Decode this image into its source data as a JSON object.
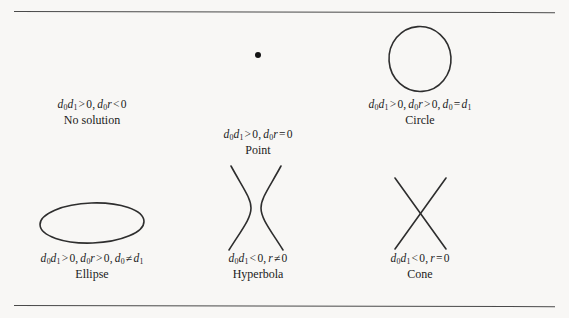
{
  "figure": {
    "background_color": "#f8f7f5",
    "stroke_color": "#2e2e2e",
    "rule_color": "#4a4a4a"
  },
  "rules": {
    "top_label": "top-horizontal-rule",
    "bottom_label": "bottom-horizontal-rule"
  },
  "panels": [
    {
      "shape": "none",
      "formula_parts": {
        "p1": "d",
        "s1": "0",
        "p2": "d",
        "s2": "1",
        "rel1": ">",
        "val1": "0",
        "comma": ",",
        "p3": "d",
        "s3": "0",
        "p4": "r",
        "rel2": "<",
        "val2": "0"
      },
      "formula_text": "d0d1 > 0, d0r < 0",
      "name": "No solution"
    },
    {
      "shape": "point",
      "formula_parts": {
        "p1": "d",
        "s1": "0",
        "p2": "d",
        "s2": "1",
        "rel1": ">",
        "val1": "0",
        "comma": ",",
        "p3": "d",
        "s3": "0",
        "p4": "r",
        "rel2": "=",
        "val2": "0"
      },
      "formula_text": "d0d1 > 0, d0r = 0",
      "name": "Point"
    },
    {
      "shape": "circle",
      "formula_parts": {
        "p1": "d",
        "s1": "0",
        "p2": "d",
        "s2": "1",
        "rel1": ">",
        "val1": "0",
        "comma": ",",
        "p3": "d",
        "s3": "0",
        "p4": "r",
        "rel2": ">",
        "val2": "0",
        "comma2": ",",
        "p5": "d",
        "s5": "0",
        "rel3": "=",
        "p6": "d",
        "s6": "1"
      },
      "formula_text": "d0d1 > 0, d0r > 0, d0 = d1",
      "name": "Circle"
    },
    {
      "shape": "ellipse",
      "formula_parts": {
        "p1": "d",
        "s1": "0",
        "p2": "d",
        "s2": "1",
        "rel1": ">",
        "val1": "0",
        "comma": ",",
        "p3": "d",
        "s3": "0",
        "p4": "r",
        "rel2": ">",
        "val2": "0",
        "comma2": ",",
        "p5": "d",
        "s5": "0",
        "rel3": "≠",
        "p6": "d",
        "s6": "1"
      },
      "formula_text": "d0d1 > 0, d0r > 0, d0 ≠ d1",
      "name": "Ellipse"
    },
    {
      "shape": "hyperbola",
      "formula_parts": {
        "p1": "d",
        "s1": "0",
        "p2": "d",
        "s2": "1",
        "rel1": "<",
        "val1": "0",
        "comma": ",",
        "p4": "r",
        "rel2": "≠",
        "val2": "0"
      },
      "formula_text": "d0d1 < 0, r ≠ 0",
      "name": "Hyperbola"
    },
    {
      "shape": "cone",
      "formula_parts": {
        "p1": "d",
        "s1": "0",
        "p2": "d",
        "s2": "1",
        "rel1": "<",
        "val1": "0",
        "comma": ",",
        "p4": "r",
        "rel2": "=",
        "val2": "0"
      },
      "formula_text": "d0d1 < 0, r = 0",
      "name": "Cone"
    }
  ]
}
